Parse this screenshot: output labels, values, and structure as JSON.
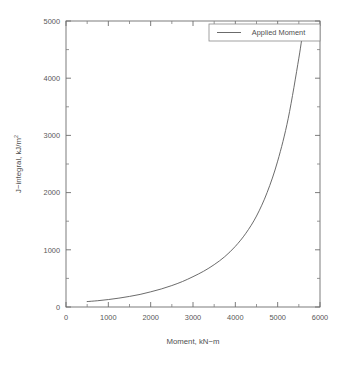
{
  "chart_data": {
    "type": "line",
    "title": "",
    "xlabel": "Moment, kN−m",
    "ylabel": "J−integral, kJ/m",
    "ylabel_superscript": "2",
    "xlim": [
      0,
      6000
    ],
    "ylim": [
      0,
      5000
    ],
    "grid": false,
    "legend_position": "top-right",
    "x_ticks": [
      0,
      1000,
      2000,
      3000,
      4000,
      5000,
      6000
    ],
    "x_tick_labels": [
      "0",
      "1000",
      "2000",
      "3000",
      "4000",
      "5000",
      "6000"
    ],
    "x_minor_tick_step": 500,
    "y_ticks": [
      0,
      1000,
      2000,
      3000,
      4000,
      5000
    ],
    "y_tick_labels": [
      "0",
      "1000",
      "2000",
      "3000",
      "4000",
      "5000"
    ],
    "y_minor_tick_step": 500,
    "series": [
      {
        "name": "Applied Moment",
        "color": "#5a5a5a",
        "x": [
          500,
          750,
          1000,
          1250,
          1500,
          1750,
          2000,
          2250,
          2500,
          2750,
          3000,
          3250,
          3500,
          3750,
          4000,
          4250,
          4500,
          4750,
          5000,
          5250,
          5500,
          5600
        ],
        "y": [
          95,
          110,
          130,
          155,
          185,
          220,
          265,
          315,
          375,
          445,
          530,
          625,
          740,
          880,
          1060,
          1290,
          1590,
          2000,
          2550,
          3300,
          4350,
          4850
        ]
      }
    ]
  },
  "legend": {
    "entries": [
      {
        "label": "Applied Moment"
      }
    ]
  },
  "axes": {
    "x_title": "Moment, kN−m",
    "y_title_main": "J−integral, kJ/m",
    "y_title_sup": "2"
  }
}
